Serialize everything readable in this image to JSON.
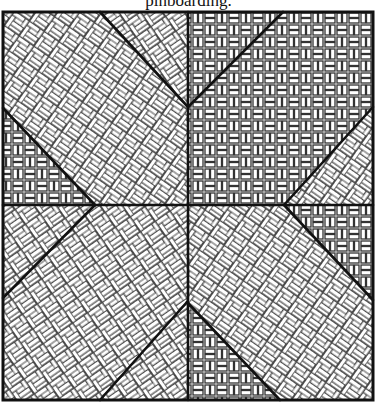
{
  "caption": "pinboarding.",
  "diagram": {
    "type": "quilt-block",
    "square": {
      "x": 3,
      "y": 12,
      "width": 370,
      "height": 388
    },
    "center": {
      "x": 188,
      "y": 205
    },
    "colors": {
      "line": "#111111",
      "fill": "#ffffff",
      "weave": "#3a3a3a"
    },
    "regions": [
      {
        "id": "top-left-large",
        "pattern": "diagonal-weave-a"
      },
      {
        "id": "top-notch-left",
        "pattern": "diagonal-weave-b"
      },
      {
        "id": "top-notch-right",
        "pattern": "orthogonal-weave"
      },
      {
        "id": "top-right-large",
        "pattern": "orthogonal-weave"
      },
      {
        "id": "left-notch-upper",
        "pattern": "orthogonal-weave"
      },
      {
        "id": "left-notch-lower",
        "pattern": "diagonal-weave-b"
      },
      {
        "id": "right-notch-upper",
        "pattern": "diagonal-weave-a"
      },
      {
        "id": "right-notch-lower",
        "pattern": "diagonal-weave-b"
      },
      {
        "id": "bottom-left-large",
        "pattern": "diagonal-weave-a"
      },
      {
        "id": "bottom-right-large",
        "pattern": "diagonal-weave-b"
      },
      {
        "id": "bottom-notch-left",
        "pattern": "diagonal-weave-a"
      },
      {
        "id": "bottom-notch-right",
        "pattern": "orthogonal-weave"
      }
    ]
  }
}
